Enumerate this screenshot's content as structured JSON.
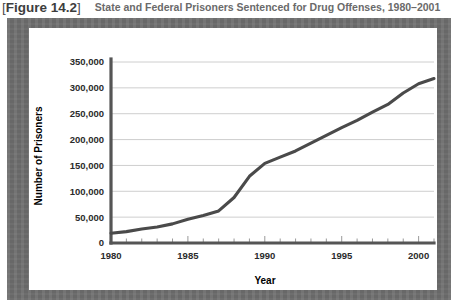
{
  "header": {
    "figure_tag": "Figure 14.2",
    "bracket_left": "[",
    "bracket_right": "]",
    "title": "State and Federal Prisoners Sentenced for Drug Offenses, 1980–2001"
  },
  "colors": {
    "plate": "#6e6e6e",
    "panel": "#ffffff",
    "line": "#4a4a4a",
    "grid": "#c8c8c8",
    "axis": "#555555",
    "tag_text": "#3d3d3d",
    "title_text": "#6a6a6a"
  },
  "chart_data": {
    "type": "line",
    "title": "State and Federal Prisoners Sentenced for Drug Offenses, 1980–2001",
    "xlabel": "Year",
    "ylabel": "Number of Prisoners",
    "xlim": [
      1980,
      2001
    ],
    "ylim": [
      0,
      350000
    ],
    "grid": true,
    "legend": null,
    "x_tick_labels": [
      "1980",
      "1985",
      "1990",
      "1995",
      "2000"
    ],
    "x_major_ticks": [
      1980,
      1985,
      1990,
      1995,
      2000
    ],
    "x_minor_tick_interval": 1,
    "y_tick_labels": [
      "0",
      "50,000",
      "100,000",
      "150,000",
      "200,000",
      "250,000",
      "300,000",
      "350,000"
    ],
    "y_ticks": [
      0,
      50000,
      100000,
      150000,
      200000,
      250000,
      300000,
      350000
    ],
    "series": [
      {
        "name": "Prisoners sentenced for drug offenses",
        "x": [
          1980,
          1981,
          1982,
          1983,
          1984,
          1985,
          1986,
          1987,
          1988,
          1989,
          1990,
          1991,
          1992,
          1993,
          1994,
          1995,
          1996,
          1997,
          1998,
          1999,
          2000,
          2001
        ],
        "values": [
          19000,
          22000,
          27000,
          31000,
          37000,
          46000,
          53000,
          62000,
          88000,
          129000,
          154000,
          166000,
          178000,
          193000,
          208000,
          223000,
          237000,
          253000,
          268000,
          290000,
          308000,
          318000
        ]
      }
    ]
  }
}
